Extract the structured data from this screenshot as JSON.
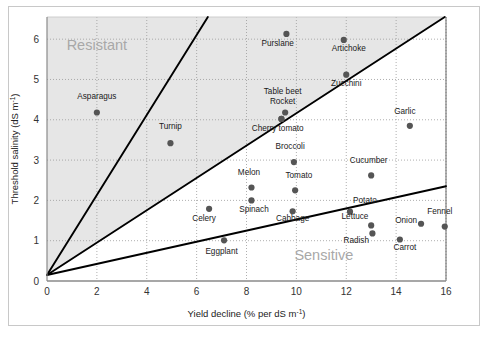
{
  "figure": {
    "background_color": "#ffffff",
    "border_color": "#c8c8c8"
  },
  "chart_data": {
    "type": "scatter",
    "title": "",
    "xlabel": "Yield decline (% per dS m",
    "xlabel_sup": "-1",
    "xlabel_tail": ")",
    "ylabel": "Threshold salinity (dS m",
    "ylabel_sup": "-1",
    "ylabel_tail": ")",
    "xlim": [
      0,
      16
    ],
    "ylim": [
      0,
      6.55
    ],
    "xticks": [
      0,
      2,
      4,
      6,
      8,
      10,
      12,
      14,
      16
    ],
    "yticks": [
      0,
      1,
      2,
      3,
      4,
      5,
      6
    ],
    "grid": "dotted",
    "grid_color": "#9a9a9a",
    "plot_background": "#ffffff",
    "shaded_region_color": "#e6e6e6",
    "point_color": "#555555",
    "point_radius": 3.1,
    "line_color": "#000000",
    "annotations": [
      {
        "text": "Resistant",
        "x": 2.0,
        "y": 5.72,
        "name": "zone-label-resistant"
      },
      {
        "text": "Sensitive",
        "x": 11.1,
        "y": 0.52,
        "name": "zone-label-sensitive"
      }
    ],
    "boundary_lines": [
      {
        "name": "steep-boundary-line",
        "x1": 0,
        "y1": 0.15,
        "x2": 6.45,
        "y2": 6.55
      },
      {
        "name": "middle-boundary-line",
        "x1": 0,
        "y1": 0.15,
        "x2": 15.95,
        "y2": 6.55
      },
      {
        "name": "shallow-boundary-line",
        "x1": 0,
        "y1": 0.15,
        "x2": 16.0,
        "y2": 2.35
      }
    ],
    "points": [
      {
        "label": "Asparagus",
        "x": 2.0,
        "y": 4.18,
        "lx": 2.0,
        "ly": 4.52,
        "anchor": "middle"
      },
      {
        "label": "Turnip",
        "x": 4.95,
        "y": 3.42,
        "lx": 4.95,
        "ly": 3.76,
        "anchor": "middle"
      },
      {
        "label": "Purslane",
        "x": 9.6,
        "y": 6.13,
        "lx": 9.25,
        "ly": 5.84,
        "anchor": "middle"
      },
      {
        "label": "Artichoke",
        "x": 11.9,
        "y": 5.98,
        "lx": 12.1,
        "ly": 5.7,
        "anchor": "middle"
      },
      {
        "label": "Zucchini",
        "x": 12.0,
        "y": 5.12,
        "lx": 12.0,
        "ly": 4.83,
        "anchor": "middle"
      },
      {
        "label": "Table beet",
        "x": 9.55,
        "y": 4.18,
        "lx": 9.45,
        "ly": 4.65,
        "anchor": "middle"
      },
      {
        "label": "Rocket",
        "x": 9.4,
        "y": 4.02,
        "lx": 9.45,
        "ly": 4.38,
        "anchor": "middle"
      },
      {
        "label": "Cherry tomato",
        "x": 9.4,
        "y": 4.02,
        "lx": 9.25,
        "ly": 3.72,
        "anchor": "middle"
      },
      {
        "label": "Garlic",
        "x": 14.55,
        "y": 3.85,
        "lx": 14.35,
        "ly": 4.14,
        "anchor": "middle"
      },
      {
        "label": "Broccoli",
        "x": 9.9,
        "y": 2.95,
        "lx": 9.75,
        "ly": 3.27,
        "anchor": "middle"
      },
      {
        "label": "Cucumber",
        "x": 13.0,
        "y": 2.62,
        "lx": 12.9,
        "ly": 2.94,
        "anchor": "middle"
      },
      {
        "label": "Melon",
        "x": 8.2,
        "y": 2.32,
        "lx": 8.1,
        "ly": 2.64,
        "anchor": "middle"
      },
      {
        "label": "Tomato",
        "x": 9.95,
        "y": 2.25,
        "lx": 10.1,
        "ly": 2.56,
        "anchor": "middle"
      },
      {
        "label": "Spinach",
        "x": 8.2,
        "y": 2.0,
        "lx": 8.3,
        "ly": 1.7,
        "anchor": "middle"
      },
      {
        "label": "Celery",
        "x": 6.5,
        "y": 1.79,
        "lx": 6.3,
        "ly": 1.48,
        "anchor": "middle"
      },
      {
        "label": "Cabbage",
        "x": 9.85,
        "y": 1.73,
        "lx": 9.85,
        "ly": 1.49,
        "anchor": "middle"
      },
      {
        "label": "Potato",
        "x": 12.15,
        "y": 1.72,
        "lx": 12.75,
        "ly": 1.93,
        "anchor": "middle"
      },
      {
        "label": "Lettuce",
        "x": 13.0,
        "y": 1.38,
        "lx": 12.35,
        "ly": 1.55,
        "anchor": "middle"
      },
      {
        "label": "Onion",
        "x": 15.0,
        "y": 1.42,
        "lx": 14.4,
        "ly": 1.45,
        "anchor": "middle"
      },
      {
        "label": "Fennel",
        "x": 15.95,
        "y": 1.35,
        "lx": 15.75,
        "ly": 1.65,
        "anchor": "middle"
      },
      {
        "label": "Radish",
        "x": 13.05,
        "y": 1.18,
        "lx": 12.4,
        "ly": 0.95,
        "anchor": "middle"
      },
      {
        "label": "Carrot",
        "x": 14.15,
        "y": 1.03,
        "lx": 14.35,
        "ly": 0.77,
        "anchor": "middle"
      },
      {
        "label": "Eggplant",
        "x": 7.1,
        "y": 1.01,
        "lx": 7.0,
        "ly": 0.66,
        "anchor": "middle"
      }
    ]
  }
}
